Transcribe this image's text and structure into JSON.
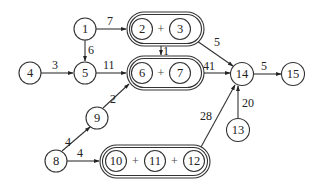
{
  "diagram": {
    "type": "directed-weighted-graph",
    "nodes": [
      {
        "id": "1",
        "label": "1",
        "x": 85,
        "y": 29
      },
      {
        "id": "4",
        "label": "4",
        "x": 30,
        "y": 73
      },
      {
        "id": "5",
        "label": "5",
        "x": 85,
        "y": 73
      },
      {
        "id": "9",
        "label": "9",
        "x": 97,
        "y": 118
      },
      {
        "id": "8",
        "label": "8",
        "x": 56,
        "y": 161
      },
      {
        "id": "14",
        "label": "14",
        "x": 242,
        "y": 74
      },
      {
        "id": "15",
        "label": "15",
        "x": 293,
        "y": 74
      },
      {
        "id": "13",
        "label": "13",
        "x": 238,
        "y": 130
      }
    ],
    "groups": [
      {
        "id": "g23",
        "members": [
          {
            "label": "2",
            "x": 142,
            "y": 29
          },
          {
            "label": "3",
            "x": 180,
            "y": 29
          }
        ],
        "plus": [
          "+"
        ],
        "box": {
          "x": 127,
          "y": 12,
          "w": 77,
          "h": 34
        }
      },
      {
        "id": "g67",
        "members": [
          {
            "label": "6",
            "x": 142,
            "y": 73
          },
          {
            "label": "7",
            "x": 180,
            "y": 73
          }
        ],
        "plus": [
          "+"
        ],
        "box": {
          "x": 127,
          "y": 56,
          "w": 77,
          "h": 34
        }
      },
      {
        "id": "g101112",
        "members": [
          {
            "label": "10",
            "x": 116,
            "y": 161
          },
          {
            "label": "11",
            "x": 155,
            "y": 161
          },
          {
            "label": "12",
            "x": 194,
            "y": 161
          }
        ],
        "plus": [
          "+",
          "+"
        ],
        "box": {
          "x": 100,
          "y": 145,
          "w": 110,
          "h": 33
        }
      }
    ],
    "edges": [
      {
        "from": "1",
        "to": "2+3",
        "weight": "7"
      },
      {
        "from": "1",
        "to": "5",
        "weight": "6"
      },
      {
        "from": "4",
        "to": "5",
        "weight": "3"
      },
      {
        "from": "5",
        "to": "6+7",
        "weight": "11"
      },
      {
        "from": "2+3",
        "to": "6+7",
        "weight": "1"
      },
      {
        "from": "2+3",
        "to": "14",
        "weight": "5"
      },
      {
        "from": "6+7",
        "to": "14",
        "weight": "41"
      },
      {
        "from": "14",
        "to": "15",
        "weight": "5"
      },
      {
        "from": "9",
        "to": "6+7",
        "weight": "2"
      },
      {
        "from": "8",
        "to": "9",
        "weight": "4"
      },
      {
        "from": "8",
        "to": "10+11+12",
        "weight": "4"
      },
      {
        "from": "10+11+12",
        "to": "14",
        "weight": "28"
      },
      {
        "from": "13",
        "to": "14",
        "weight": "20"
      }
    ]
  },
  "labels": {
    "n1": "1",
    "n2": "2",
    "n3": "3",
    "n4": "4",
    "n5": "5",
    "n6": "6",
    "n7": "7",
    "n8": "8",
    "n9": "9",
    "n10": "10",
    "n11": "11",
    "n12": "12",
    "n13": "13",
    "n14": "14",
    "n15": "15",
    "plus": "+",
    "w_1_23": "7",
    "w_1_5": "6",
    "w_4_5": "3",
    "w_5_67": "11",
    "w_23_67": "1",
    "w_23_14": "5",
    "w_67_14": "41",
    "w_14_15": "5",
    "w_9_67": "2",
    "w_8_9": "4",
    "w_8_g": "4",
    "w_g_14": "28",
    "w_13_14": "20"
  }
}
